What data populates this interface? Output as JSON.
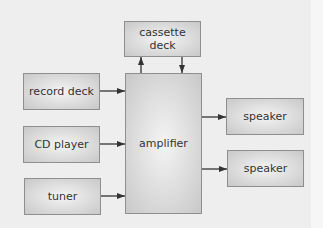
{
  "diagram": {
    "nodes": {
      "cassette_deck": {
        "label": "cassette deck",
        "line1": "cassette",
        "line2": "deck"
      },
      "amplifier": {
        "label": "amplifier"
      },
      "record_deck": {
        "label": "record deck"
      },
      "cd_player": {
        "label": "CD player"
      },
      "tuner": {
        "label": "tuner"
      },
      "speaker_1": {
        "label": "speaker"
      },
      "speaker_2": {
        "label": "speaker"
      }
    },
    "edges": [
      {
        "from": "record deck",
        "to": "amplifier"
      },
      {
        "from": "CD player",
        "to": "amplifier"
      },
      {
        "from": "tuner",
        "to": "amplifier"
      },
      {
        "from": "amplifier",
        "to": "cassette deck"
      },
      {
        "from": "cassette deck",
        "to": "amplifier"
      },
      {
        "from": "amplifier",
        "to": "speaker"
      },
      {
        "from": "amplifier",
        "to": "speaker"
      }
    ],
    "colors": {
      "background": "#eeeeee",
      "box_border": "#8f8f8f",
      "box_fill": "#dcdcdc",
      "arrow": "#333333",
      "text": "#333333"
    }
  }
}
